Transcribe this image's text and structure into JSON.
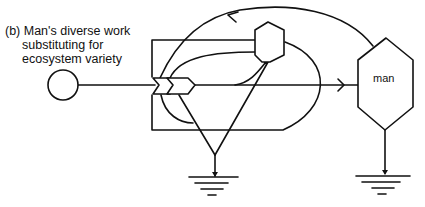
{
  "caption": {
    "line1": "(b) Man's diverse work",
    "line2": "substituting for",
    "line3": "ecosystem variety"
  },
  "diagram": {
    "type": "energy systems diagram (Odum symbols)",
    "nodes": [
      {
        "id": "source",
        "symbol": "circle",
        "label": ""
      },
      {
        "id": "interaction",
        "symbol": "double-chevron work gate",
        "label": ""
      },
      {
        "id": "ecosystem-consumer",
        "symbol": "small hexagon",
        "label": ""
      },
      {
        "id": "man",
        "symbol": "hexagon",
        "label": "man"
      },
      {
        "id": "heat-sink-ecosystem",
        "symbol": "ground",
        "label": ""
      },
      {
        "id": "heat-sink-man",
        "symbol": "ground",
        "label": ""
      }
    ],
    "man_label": "man",
    "stroke_color": "#111111",
    "background": "#ffffff"
  }
}
